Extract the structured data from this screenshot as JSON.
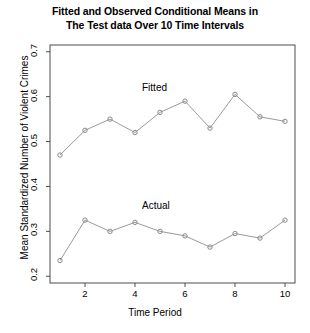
{
  "chart_data": {
    "type": "line",
    "title": "Fitted and Observed Conditional Means in The Test data Over 10 Time Intervals",
    "title_lines": [
      "Fitted and Observed Conditional Means in",
      "The Test data Over 10 Time Intervals"
    ],
    "xlabel": "Time Period",
    "ylabel": "Mean Standardized Number of Violent Crimes",
    "x": [
      1,
      2,
      3,
      4,
      5,
      6,
      7,
      8,
      9,
      10
    ],
    "xlim": [
      0.6,
      10.4
    ],
    "ylim": [
      0.185,
      0.715
    ],
    "xticks": [
      2,
      4,
      6,
      8,
      10
    ],
    "xtick_labels": [
      "2",
      "4",
      "6",
      "8",
      "10"
    ],
    "yticks": [
      0.2,
      0.3,
      0.4,
      0.5,
      0.6,
      0.7
    ],
    "ytick_labels": [
      "0.2",
      "0.3",
      "0.4",
      "0.5",
      "0.6",
      "0.7"
    ],
    "grid": false,
    "legend_position": "inline-annotations",
    "marker": "open-circle",
    "line_color": "#9a9a9a",
    "marker_color": "#8a8a8a",
    "axis_color": "#4d4d4d",
    "series": [
      {
        "name": "Fitted",
        "label": "Fitted",
        "label_x": 5.0,
        "label_y": 0.617,
        "values": [
          0.47,
          0.525,
          0.55,
          0.52,
          0.565,
          0.59,
          0.53,
          0.605,
          0.555,
          0.545
        ]
      },
      {
        "name": "Actual",
        "label": "Actual",
        "label_x": 5.0,
        "label_y": 0.355,
        "values": [
          0.235,
          0.325,
          0.3,
          0.32,
          0.3,
          0.29,
          0.265,
          0.295,
          0.285,
          0.325
        ]
      }
    ]
  }
}
